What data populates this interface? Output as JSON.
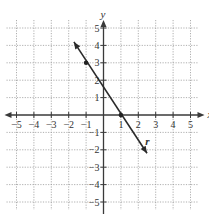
{
  "chart_data": {
    "type": "line",
    "title": "",
    "xlabel": "x",
    "ylabel": "y",
    "xlim": [
      -5,
      5
    ],
    "ylim": [
      -5,
      5
    ],
    "grid": true,
    "x_ticks": [
      -5,
      -4,
      -3,
      -2,
      -1,
      1,
      2,
      3,
      4,
      5
    ],
    "y_ticks": [
      5,
      4,
      3,
      2,
      1,
      -1,
      -2,
      -3,
      -4,
      -5
    ],
    "series": [
      {
        "name": "r",
        "equation": "y = -1.5x + 1.5",
        "arrows": "both",
        "from": [
          -1.7,
          4.2
        ],
        "to": [
          2.5,
          -2.2
        ],
        "marked_points": [
          [
            -1,
            3
          ],
          [
            1,
            0
          ]
        ]
      }
    ],
    "annotations": [
      {
        "text": "r",
        "x": 2.4,
        "y": -1.5
      }
    ]
  },
  "pixel": {
    "origin_x": 103.5,
    "origin_y": 115,
    "unit": 17.4,
    "colors": {
      "grid": "#9a9a9a",
      "axis": "#3a3a3a",
      "line": "#2a2a2a"
    }
  }
}
